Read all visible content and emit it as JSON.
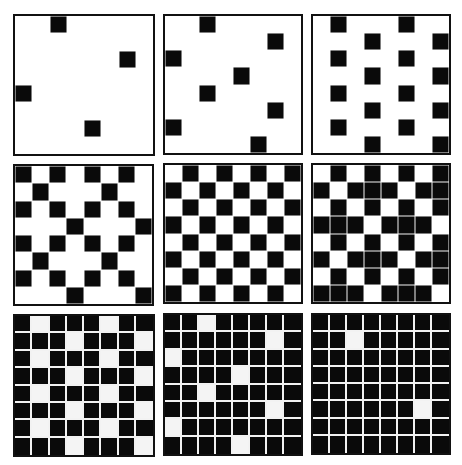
{
  "figure": {
    "colors": {
      "on": "#0a0a0a",
      "off": "#ffffff",
      "border": "#111111"
    },
    "panels": [
      {
        "id": 1,
        "x": 13,
        "y": 14,
        "w": 142,
        "h": 142,
        "style": "g1",
        "rows": [
          "00100000",
          "00000000",
          "00000010",
          "00000000",
          "10000000",
          "00000000",
          "00001000",
          "00000000"
        ]
      },
      {
        "id": 2,
        "x": 163,
        "y": 14,
        "w": 140,
        "h": 141,
        "style": "g1",
        "rows": [
          "00100000",
          "00000010",
          "10000000",
          "00001000",
          "00100000",
          "00000010",
          "10000000",
          "00000100"
        ]
      },
      {
        "id": 3,
        "x": 311,
        "y": 14,
        "w": 140,
        "h": 141,
        "style": "g1",
        "rows": [
          "01000100",
          "00010001",
          "01000100",
          "00010001",
          "01000100",
          "00010001",
          "01000100",
          "00010001"
        ]
      },
      {
        "id": 4,
        "x": 13,
        "y": 164,
        "w": 141,
        "h": 142,
        "style": "g1",
        "rows": [
          "10101010",
          "01000100",
          "10101010",
          "00010001",
          "10101010",
          "01000100",
          "10101010",
          "00010001"
        ]
      },
      {
        "id": 5,
        "x": 163,
        "y": 163,
        "w": 140,
        "h": 141,
        "style": "g1",
        "rows": [
          "01010101",
          "10101010",
          "01010101",
          "10101010",
          "01010101",
          "10101010",
          "01010101",
          "10101010"
        ]
      },
      {
        "id": 6,
        "x": 311,
        "y": 163,
        "w": 140,
        "h": 141,
        "style": "g1",
        "rows": [
          "01010101",
          "10111011",
          "01010101",
          "11101110",
          "01010101",
          "10111011",
          "01010101",
          "11101110"
        ]
      },
      {
        "id": 7,
        "x": 13,
        "y": 314,
        "w": 142,
        "h": 143,
        "style": "g2",
        "rows": [
          "10111011",
          "11101110",
          "10111011",
          "11101110",
          "10111011",
          "11101110",
          "10111011",
          "11101110"
        ]
      },
      {
        "id": 8,
        "x": 163,
        "y": 313,
        "w": 140,
        "h": 143,
        "style": "g2",
        "rows": [
          "11011111",
          "11111101",
          "01111111",
          "11110111",
          "11011111",
          "11111101",
          "01111111",
          "11110111"
        ]
      },
      {
        "id": 9,
        "x": 311,
        "y": 313,
        "w": 140,
        "h": 142,
        "style": "g2",
        "rows": [
          "11111111",
          "11011111",
          "11111111",
          "11111111",
          "11111111",
          "11111101",
          "11111111",
          "11111111"
        ]
      }
    ]
  }
}
